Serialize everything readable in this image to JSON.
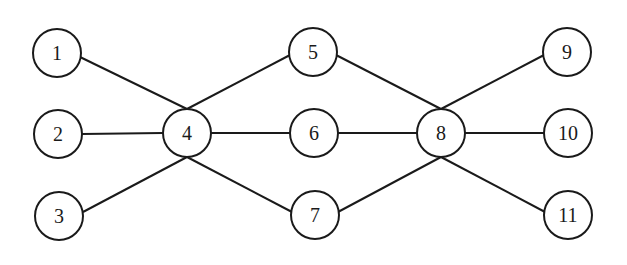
{
  "diagram": {
    "type": "graph",
    "stroke_color": "#1a1a1a",
    "node_radius": 24,
    "nodes": [
      {
        "id": "1",
        "label": "1",
        "x": 57,
        "y": 53
      },
      {
        "id": "2",
        "label": "2",
        "x": 58,
        "y": 134
      },
      {
        "id": "3",
        "label": "3",
        "x": 59,
        "y": 216
      },
      {
        "id": "4",
        "label": "4",
        "x": 187,
        "y": 133
      },
      {
        "id": "5",
        "label": "5",
        "x": 313,
        "y": 52
      },
      {
        "id": "6",
        "label": "6",
        "x": 314,
        "y": 133
      },
      {
        "id": "7",
        "label": "7",
        "x": 315,
        "y": 215
      },
      {
        "id": "8",
        "label": "8",
        "x": 441,
        "y": 133
      },
      {
        "id": "9",
        "label": "9",
        "x": 567,
        "y": 52
      },
      {
        "id": "10",
        "label": "10",
        "x": 568,
        "y": 133
      },
      {
        "id": "11",
        "label": "11",
        "x": 568,
        "y": 215
      }
    ],
    "edges": [
      {
        "from": "1",
        "to": "4",
        "x1": 80,
        "y1": 57,
        "x2": 187,
        "y2": 109
      },
      {
        "from": "2",
        "to": "4",
        "x1": 82,
        "y1": 134,
        "x2": 163,
        "y2": 133
      },
      {
        "from": "3",
        "to": "4",
        "x1": 83,
        "y1": 212,
        "x2": 187,
        "y2": 157
      },
      {
        "from": "4",
        "to": "5",
        "x1": 187,
        "y1": 109,
        "x2": 290,
        "y2": 55
      },
      {
        "from": "4",
        "to": "6",
        "x1": 211,
        "y1": 133,
        "x2": 290,
        "y2": 133
      },
      {
        "from": "4",
        "to": "7",
        "x1": 187,
        "y1": 157,
        "x2": 292,
        "y2": 212
      },
      {
        "from": "5",
        "to": "8",
        "x1": 336,
        "y1": 55,
        "x2": 441,
        "y2": 109
      },
      {
        "from": "6",
        "to": "8",
        "x1": 338,
        "y1": 133,
        "x2": 417,
        "y2": 133
      },
      {
        "from": "7",
        "to": "8",
        "x1": 338,
        "y1": 212,
        "x2": 441,
        "y2": 157
      },
      {
        "from": "8",
        "to": "9",
        "x1": 441,
        "y1": 109,
        "x2": 544,
        "y2": 55
      },
      {
        "from": "8",
        "to": "10",
        "x1": 465,
        "y1": 133,
        "x2": 544,
        "y2": 133
      },
      {
        "from": "8",
        "to": "11",
        "x1": 441,
        "y1": 157,
        "x2": 545,
        "y2": 212
      }
    ]
  }
}
